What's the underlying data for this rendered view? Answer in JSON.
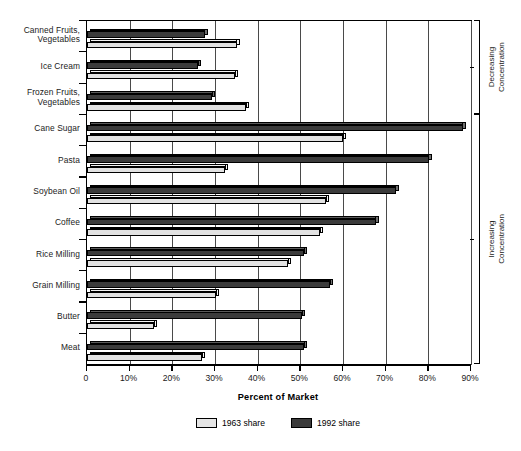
{
  "chart_data": {
    "type": "bar",
    "orientation": "horizontal",
    "title": "",
    "xlabel": "Percent of Market",
    "ylabel": "",
    "xlim": [
      0,
      90
    ],
    "xticks": [
      "0",
      "10%",
      "20%",
      "30%",
      "40%",
      "50%",
      "60%",
      "70%",
      "80%",
      "90%"
    ],
    "xtick_values": [
      0,
      10,
      20,
      30,
      40,
      50,
      60,
      70,
      80,
      90
    ],
    "grid": "vertical",
    "legend_position": "bottom",
    "categories": [
      "Canned Fruits, Vegetables",
      "Ice Cream",
      "Frozen Fruits, Vegetables",
      "Cane Sugar",
      "Pasta",
      "Soybean Oil",
      "Coffee",
      "Rice Milling",
      "Grain Milling",
      "Butter",
      "Meat"
    ],
    "series": [
      {
        "name": "1963 share",
        "color": "#e5e5e5",
        "values": [
          35.0,
          34.7,
          37.3,
          60.0,
          32.4,
          56.0,
          54.5,
          47.0,
          30.3,
          15.6,
          27.0
        ]
      },
      {
        "name": "1992 share",
        "color": "#3b3b3b",
        "values": [
          27.5,
          26.0,
          29.3,
          88.0,
          80.0,
          72.3,
          67.6,
          50.8,
          57.0,
          50.4,
          50.8
        ]
      }
    ],
    "annotations": [
      {
        "label": "Decreasing Concentration",
        "categories": [
          "Canned Fruits, Vegetables",
          "Ice Cream",
          "Frozen Fruits, Vegetables"
        ]
      },
      {
        "label": "Increasing Concentration",
        "categories": [
          "Cane Sugar",
          "Pasta",
          "Soybean Oil",
          "Coffee",
          "Rice Milling",
          "Grain Milling",
          "Butter",
          "Meat"
        ]
      }
    ]
  },
  "brackets": {
    "decreasing": "Decreasing\nConcentration",
    "decreasing_line1": "Decreasing",
    "decreasing_line2": "Concentration",
    "increasing_line1": "Increasing",
    "increasing_line2": "Concentration"
  }
}
